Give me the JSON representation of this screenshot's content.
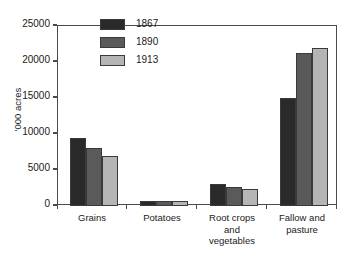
{
  "chart_data": {
    "type": "bar",
    "title": "",
    "xlabel": "",
    "ylabel": "'000 acres",
    "ylim": [
      0,
      25000
    ],
    "yticks": [
      0,
      5000,
      10000,
      15000,
      20000,
      25000
    ],
    "ytick_labels": [
      "0",
      "5000",
      "10000",
      "15000",
      "20000",
      "25000"
    ],
    "grid": false,
    "legend_position": "top-center",
    "categories": [
      "Grains",
      "Potatoes",
      "Root crops and vegetables",
      "Fallow and pasture"
    ],
    "category_labels": [
      [
        "Grains"
      ],
      [
        "Potatoes"
      ],
      [
        "Root crops",
        "and",
        "vegetables"
      ],
      [
        "Fallow and",
        "pasture"
      ]
    ],
    "series": [
      {
        "name": "1867",
        "color": "#2a2a2a",
        "values": [
          9400,
          700,
          3000,
          15000
        ]
      },
      {
        "name": "1890",
        "color": "#5a5a5a",
        "values": [
          8000,
          650,
          2700,
          21200
        ]
      },
      {
        "name": "1913",
        "color": "#b5b5b5",
        "values": [
          7000,
          700,
          2300,
          21900
        ]
      }
    ]
  },
  "legend": {
    "items": [
      {
        "label": "1867",
        "color": "#2a2a2a"
      },
      {
        "label": "1890",
        "color": "#5a5a5a"
      },
      {
        "label": "1913",
        "color": "#b5b5b5"
      }
    ]
  },
  "axis": {
    "y_title": "'000 acres"
  }
}
